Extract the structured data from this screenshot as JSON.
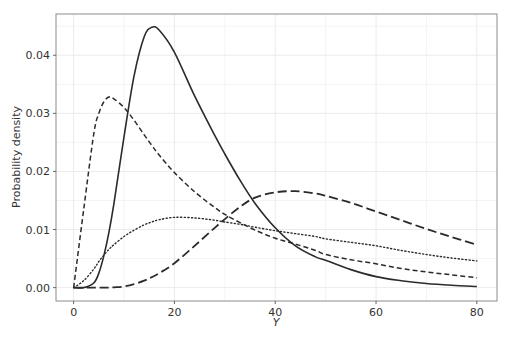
{
  "chart_data": {
    "type": "line",
    "title": "",
    "xlabel": "Y",
    "ylabel": "Probability density",
    "xlim": [
      -3.5,
      84
    ],
    "ylim": [
      -0.0023,
      0.0471
    ],
    "xticks": [
      0,
      20,
      40,
      60,
      80
    ],
    "xtick_labels": [
      "0",
      "20",
      "40",
      "60",
      "80"
    ],
    "yticks": [
      0.0,
      0.01,
      0.02,
      0.03,
      0.04
    ],
    "ytick_labels": [
      "0.00",
      "0.01",
      "0.02",
      "0.03",
      "0.04"
    ],
    "grid": true,
    "legend": null,
    "x": [
      0,
      2,
      4,
      5,
      6,
      7,
      8,
      10,
      12,
      14,
      15.5,
      17,
      20,
      24,
      28,
      30,
      33,
      36,
      40,
      44,
      48,
      50,
      55,
      60,
      65,
      70,
      75,
      80
    ],
    "series": [
      {
        "name": "solid",
        "line_style": "solid",
        "values": [
          0.0,
          0.0,
          0.0008,
          0.0025,
          0.0055,
          0.0095,
          0.0145,
          0.026,
          0.0365,
          0.0432,
          0.0448,
          0.0443,
          0.0405,
          0.033,
          0.0262,
          0.023,
          0.0185,
          0.0145,
          0.0103,
          0.0072,
          0.0053,
          0.0047,
          0.0031,
          0.0019,
          0.0012,
          0.0007,
          0.0004,
          0.0002
        ]
      },
      {
        "name": "short-dash",
        "line_style": "dashed-short",
        "values": [
          0.0,
          0.0135,
          0.0265,
          0.03,
          0.032,
          0.0328,
          0.0325,
          0.031,
          0.0288,
          0.0263,
          0.0245,
          0.0228,
          0.0198,
          0.0165,
          0.0138,
          0.0126,
          0.0112,
          0.0099,
          0.0085,
          0.0075,
          0.0064,
          0.0057,
          0.0048,
          0.0041,
          0.0033,
          0.0027,
          0.0022,
          0.0017
        ]
      },
      {
        "name": "dotted",
        "line_style": "dotted",
        "values": [
          0.0,
          0.0012,
          0.0032,
          0.0045,
          0.0056,
          0.0066,
          0.0074,
          0.0088,
          0.0099,
          0.0108,
          0.0113,
          0.0117,
          0.0121,
          0.012,
          0.0116,
          0.0113,
          0.0109,
          0.0104,
          0.0098,
          0.0093,
          0.0088,
          0.0084,
          0.0078,
          0.0072,
          0.0064,
          0.0057,
          0.0051,
          0.0046
        ]
      },
      {
        "name": "long-dash",
        "line_style": "dashed-long",
        "values": [
          0.0,
          0.0,
          0.0,
          0.0,
          0.0,
          0.0,
          5e-05,
          0.0002,
          0.0006,
          0.0012,
          0.0018,
          0.0025,
          0.0042,
          0.0072,
          0.0103,
          0.0118,
          0.0139,
          0.0155,
          0.0164,
          0.0166,
          0.0162,
          0.0158,
          0.0146,
          0.0131,
          0.0116,
          0.0101,
          0.0087,
          0.0074
        ]
      }
    ]
  },
  "style": {
    "line_color": "#2b2b2b",
    "grid_color": "#ebebeb",
    "frame_color": "#8c8c8c",
    "background": "#ffffff"
  }
}
